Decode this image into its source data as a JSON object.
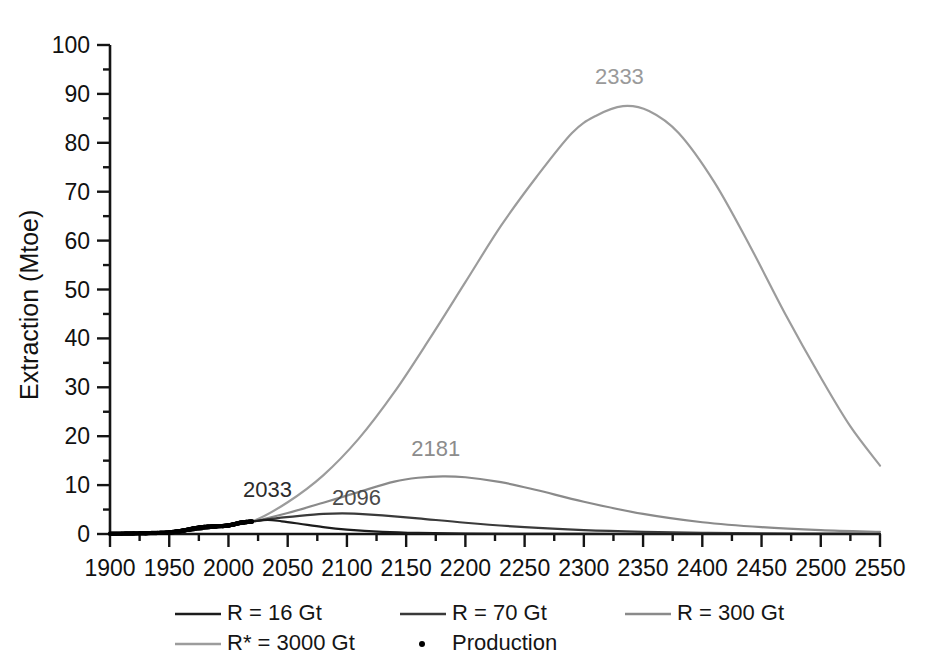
{
  "chart_data": {
    "type": "line",
    "title": "",
    "xlabel": "",
    "ylabel": "Extraction (Mtoe)",
    "xlim": [
      1900,
      2550
    ],
    "ylim": [
      0,
      100
    ],
    "xticks": [
      1900,
      1950,
      2000,
      2050,
      2100,
      2150,
      2200,
      2250,
      2300,
      2350,
      2400,
      2450,
      2500,
      2550
    ],
    "yticks": [
      0,
      10,
      20,
      30,
      40,
      50,
      60,
      70,
      80,
      90,
      100
    ],
    "xtick_labels": [
      "1900",
      "1950",
      "2000",
      "2050",
      "2100",
      "2150",
      "2200",
      "2250",
      "2300",
      "2350",
      "2400",
      "2450",
      "2500",
      "2550"
    ],
    "ytick_labels": [
      "0",
      "10",
      "20",
      "30",
      "40",
      "50",
      "60",
      "70",
      "80",
      "90",
      "100"
    ],
    "xminor_step": 25,
    "yminor_step": 5,
    "grid": false,
    "legend_position": "below-axes",
    "annotations": [
      {
        "text": "2033",
        "x": 2033,
        "y": 7.5,
        "color": "#2b2b2b",
        "series": "R = 16 Gt"
      },
      {
        "text": "2096",
        "x": 2108,
        "y": 6.0,
        "color": "#4a4a4a",
        "series": "R = 70 Gt"
      },
      {
        "text": "2181",
        "x": 2175,
        "y": 16.0,
        "color": "#8c8c8c",
        "series": "R = 300 Gt"
      },
      {
        "text": "2333",
        "x": 2330,
        "y": 92.0,
        "color": "#9a9a9a",
        "series": "R* = 3000 Gt"
      }
    ],
    "series": [
      {
        "name": "R = 16 Gt",
        "color": "#1c1c1c",
        "width": 2.2,
        "peak_year": 2033,
        "peak_value": 2.9,
        "ultimate_Gt": 16,
        "x": [
          1900,
          1950,
          1980,
          2000,
          2010,
          2020,
          2033,
          2045,
          2060,
          2080,
          2100,
          2130,
          2160,
          2200,
          2250,
          2300,
          2350,
          2400,
          2450,
          2500,
          2550
        ],
        "values": [
          0.05,
          0.3,
          1.1,
          1.8,
          2.2,
          2.55,
          2.9,
          2.6,
          2.1,
          1.4,
          0.9,
          0.45,
          0.22,
          0.09,
          0.03,
          0.01,
          0.0,
          0.0,
          0.0,
          0.0,
          0.0
        ]
      },
      {
        "name": "R = 70 Gt",
        "color": "#3a3a3a",
        "width": 2.2,
        "peak_year": 2096,
        "peak_value": 4.2,
        "ultimate_Gt": 70,
        "x": [
          1900,
          1950,
          1980,
          2000,
          2020,
          2040,
          2060,
          2080,
          2096,
          2110,
          2130,
          2160,
          2200,
          2250,
          2300,
          2350,
          2400,
          2450,
          2500,
          2550
        ],
        "values": [
          0.05,
          0.3,
          1.1,
          1.8,
          2.55,
          3.2,
          3.7,
          4.1,
          4.2,
          4.1,
          3.8,
          3.2,
          2.3,
          1.4,
          0.8,
          0.45,
          0.25,
          0.13,
          0.07,
          0.04
        ]
      },
      {
        "name": "R = 300 Gt",
        "color": "#8a8a8a",
        "width": 2.2,
        "peak_year": 2181,
        "peak_value": 11.8,
        "ultimate_Gt": 300,
        "x": [
          1900,
          1950,
          1980,
          2000,
          2020,
          2050,
          2080,
          2110,
          2140,
          2160,
          2181,
          2200,
          2230,
          2260,
          2300,
          2350,
          2400,
          2450,
          2500,
          2550
        ],
        "values": [
          0.05,
          0.3,
          1.1,
          1.8,
          2.55,
          4.3,
          6.4,
          8.6,
          10.7,
          11.5,
          11.8,
          11.6,
          10.6,
          9.0,
          6.6,
          4.1,
          2.4,
          1.4,
          0.8,
          0.45
        ]
      },
      {
        "name": "R* = 3000 Gt",
        "color": "#9c9c9c",
        "width": 2.2,
        "peak_year": 2333,
        "peak_value": 87.5,
        "ultimate_Gt": 3000,
        "x": [
          1900,
          1950,
          1980,
          2000,
          2020,
          2050,
          2080,
          2110,
          2140,
          2170,
          2200,
          2230,
          2260,
          2290,
          2310,
          2333,
          2355,
          2380,
          2410,
          2440,
          2470,
          2500,
          2525,
          2550
        ],
        "values": [
          0.05,
          0.3,
          1.1,
          1.8,
          2.55,
          6.5,
          12.0,
          19.5,
          29.0,
          40.0,
          51.5,
          63.0,
          73.0,
          82.0,
          85.5,
          87.5,
          86.5,
          82.0,
          72.0,
          59.0,
          45.0,
          32.0,
          22.0,
          14.0
        ]
      },
      {
        "name": "Production",
        "color": "#000000",
        "marker": "dot",
        "x": [
          1900,
          1910,
          1920,
          1930,
          1940,
          1950,
          1955,
          1960,
          1965,
          1970,
          1975,
          1980,
          1985,
          1990,
          1995,
          2000,
          2005,
          2010,
          2015,
          2020
        ],
        "values": [
          0.05,
          0.08,
          0.12,
          0.16,
          0.22,
          0.32,
          0.45,
          0.62,
          0.85,
          1.1,
          1.3,
          1.45,
          1.5,
          1.6,
          1.62,
          1.75,
          2.0,
          2.3,
          2.45,
          2.55
        ]
      }
    ]
  },
  "axes": {
    "y_title": "Extraction (Mtoe)"
  },
  "legend": {
    "entries": [
      {
        "label": "R = 16 Gt",
        "color": "#1c1c1c",
        "marker": "line"
      },
      {
        "label": "R = 70 Gt",
        "color": "#3a3a3a",
        "marker": "line"
      },
      {
        "label": "R = 300 Gt",
        "color": "#8a8a8a",
        "marker": "line"
      },
      {
        "label": "R* = 3000 Gt",
        "color": "#9c9c9c",
        "marker": "line"
      },
      {
        "label": "Production",
        "color": "#000000",
        "marker": "dot"
      }
    ]
  }
}
